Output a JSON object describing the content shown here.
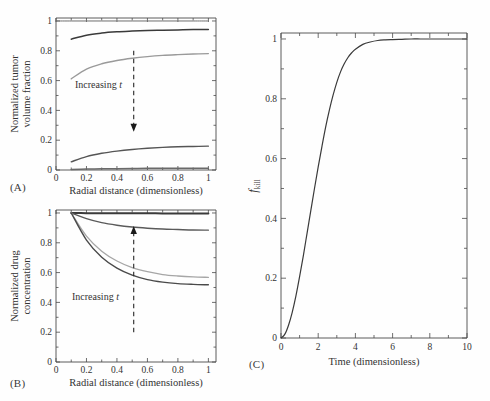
{
  "figure": {
    "background_color": "#fefefe",
    "axis_color": "#4a4a4a",
    "text_color": "#333333"
  },
  "panels": {
    "a": {
      "label": "(A)"
    },
    "b": {
      "label": "(B)"
    },
    "c": {
      "label": "(C)"
    }
  },
  "annotations": {
    "increasing_word": "Increasing",
    "increasing_var": "t",
    "arrow_a_direction": "down",
    "arrow_b_direction": "up"
  },
  "chart_data": [
    {
      "id": "panel-a",
      "type": "line",
      "title": "",
      "panel_label": "(A)",
      "xlabel": "Radial distance (dimensionless)",
      "ylabel": "Normalized tumor volume fraction",
      "xlim": [
        0,
        1.05
      ],
      "ylim": [
        0,
        1.02
      ],
      "xticks": [
        0,
        0.2,
        0.4,
        0.6,
        0.8,
        1
      ],
      "xtick_labels": [
        "0",
        "0.2",
        "0.4",
        "0.6",
        "0.8",
        "1"
      ],
      "yticks": [
        0,
        0.2,
        0.4,
        0.6,
        0.8,
        1
      ],
      "ytick_labels": [
        "0",
        "0.2",
        "0.4",
        "0.6",
        "0.8",
        "1"
      ],
      "minor_xticks": [
        0.1,
        0.3,
        0.5,
        0.7,
        0.9
      ],
      "minor_yticks": [
        0.1,
        0.3,
        0.5,
        0.7,
        0.9
      ],
      "grid": false,
      "legend": "none",
      "annotation": "Increasing t",
      "arrow": {
        "x": 0.51,
        "y_start": 0.8,
        "y_end": 0.27,
        "direction": "down",
        "style": "dashed"
      },
      "series": [
        {
          "name": "t1",
          "color": "#6e6e6e",
          "width": 1.0,
          "x": [
            0.0,
            0.1,
            0.2,
            0.3,
            0.4,
            0.5,
            0.6,
            0.7,
            0.8,
            0.9,
            1.0
          ],
          "values": [
            1.0,
            1.0,
            1.0,
            1.0,
            1.0,
            1.0,
            1.0,
            1.0,
            1.0,
            1.0,
            1.0
          ]
        },
        {
          "name": "t2",
          "color": "#3a3a3a",
          "width": 1.5,
          "x": [
            0.1,
            0.2,
            0.3,
            0.4,
            0.5,
            0.6,
            0.7,
            0.8,
            0.9,
            1.0
          ],
          "values": [
            0.878,
            0.905,
            0.919,
            0.927,
            0.932,
            0.936,
            0.938,
            0.94,
            0.942,
            0.943
          ]
        },
        {
          "name": "t3",
          "color": "#9a9a9a",
          "width": 1.4,
          "x": [
            0.1,
            0.2,
            0.3,
            0.4,
            0.5,
            0.6,
            0.7,
            0.8,
            0.9,
            1.0
          ],
          "values": [
            0.612,
            0.677,
            0.713,
            0.735,
            0.75,
            0.761,
            0.769,
            0.774,
            0.778,
            0.781
          ]
        },
        {
          "name": "t4",
          "color": "#555555",
          "width": 1.4,
          "x": [
            0.1,
            0.2,
            0.3,
            0.4,
            0.5,
            0.6,
            0.7,
            0.8,
            0.9,
            1.0
          ],
          "values": [
            0.055,
            0.09,
            0.112,
            0.127,
            0.138,
            0.146,
            0.152,
            0.156,
            0.158,
            0.16
          ]
        },
        {
          "name": "t5",
          "color": "#6a6a6a",
          "width": 1.5,
          "x": [
            0.1,
            0.2,
            0.3,
            0.4,
            0.5,
            0.6,
            0.7,
            0.8,
            0.9,
            1.0
          ],
          "values": [
            0.004,
            0.006,
            0.008,
            0.009,
            0.01,
            0.011,
            0.011,
            0.012,
            0.012,
            0.012
          ]
        }
      ]
    },
    {
      "id": "panel-b",
      "type": "line",
      "title": "",
      "panel_label": "(B)",
      "xlabel": "Radial distance (dimensionless)",
      "ylabel": "Normalized drug concentration",
      "xlim": [
        0,
        1.05
      ],
      "ylim": [
        0,
        1.02
      ],
      "xticks": [
        0,
        0.2,
        0.4,
        0.6,
        0.8,
        1
      ],
      "xtick_labels": [
        "0",
        "0.2",
        "0.4",
        "0.6",
        "0.8",
        "1"
      ],
      "yticks": [
        0,
        0.2,
        0.4,
        0.6,
        0.8,
        1
      ],
      "ytick_labels": [
        "0",
        "0.2",
        "0.4",
        "0.6",
        "0.8",
        "1"
      ],
      "minor_xticks": [
        0.1,
        0.3,
        0.5,
        0.7,
        0.9
      ],
      "minor_yticks": [
        0.1,
        0.3,
        0.5,
        0.7,
        0.9
      ],
      "grid": false,
      "legend": "none",
      "annotation": "Increasing t",
      "arrow": {
        "x": 0.51,
        "y_start": 0.2,
        "y_end": 0.9,
        "direction": "up",
        "style": "dashed"
      },
      "series": [
        {
          "name": "t1",
          "color": "#3a3a3a",
          "width": 2.0,
          "x": [
            0.1,
            0.2,
            0.3,
            0.4,
            0.5,
            0.6,
            0.7,
            0.8,
            0.9,
            1.0
          ],
          "values": [
            1.0,
            0.999,
            0.999,
            0.998,
            0.998,
            0.998,
            0.997,
            0.997,
            0.997,
            0.997
          ]
        },
        {
          "name": "t2",
          "color": "#5a5a5a",
          "width": 1.4,
          "x": [
            0.1,
            0.2,
            0.3,
            0.4,
            0.5,
            0.6,
            0.7,
            0.8,
            0.9,
            1.0
          ],
          "values": [
            1.0,
            0.962,
            0.935,
            0.918,
            0.906,
            0.898,
            0.892,
            0.889,
            0.886,
            0.885
          ]
        },
        {
          "name": "t3",
          "color": "#a6a6a6",
          "width": 1.3,
          "x": [
            0.1,
            0.2,
            0.3,
            0.4,
            0.5,
            0.6,
            0.7,
            0.8,
            0.9,
            1.0
          ],
          "values": [
            1.0,
            0.845,
            0.744,
            0.678,
            0.634,
            0.606,
            0.587,
            0.577,
            0.571,
            0.568
          ]
        },
        {
          "name": "t4",
          "color": "#4a4a4a",
          "width": 1.4,
          "x": [
            0.1,
            0.2,
            0.3,
            0.4,
            0.5,
            0.6,
            0.7,
            0.8,
            0.9,
            1.0
          ],
          "values": [
            1.0,
            0.818,
            0.703,
            0.63,
            0.583,
            0.553,
            0.536,
            0.526,
            0.521,
            0.518
          ]
        }
      ]
    },
    {
      "id": "panel-c",
      "type": "line",
      "title": "",
      "panel_label": "(C)",
      "xlabel": "Time (dimensionless)",
      "ylabel": "f_kill",
      "ylabel_base": "f",
      "ylabel_sub": "kill",
      "xlim": [
        0,
        10
      ],
      "ylim": [
        0,
        1.02
      ],
      "xticks": [
        0,
        2,
        4,
        6,
        8,
        10
      ],
      "xtick_labels": [
        "0",
        "2",
        "4",
        "6",
        "8",
        "10"
      ],
      "yticks": [
        0,
        0.2,
        0.4,
        0.6,
        0.8,
        1
      ],
      "ytick_labels": [
        "0",
        "0.2",
        "0.4",
        "0.6",
        "0.8",
        "1"
      ],
      "minor_xticks": [
        1,
        3,
        5,
        7,
        9
      ],
      "minor_yticks": [
        0.1,
        0.3,
        0.5,
        0.7,
        0.9
      ],
      "grid": false,
      "legend": "none",
      "series": [
        {
          "name": "f_kill",
          "color": "#3a3a3a",
          "width": 1.2,
          "x": [
            0,
            0.2,
            0.4,
            0.6,
            0.8,
            1.0,
            1.2,
            1.4,
            1.6,
            1.8,
            2.0,
            2.2,
            2.4,
            2.6,
            2.8,
            3.0,
            3.2,
            3.4,
            3.6,
            3.8,
            4.0,
            4.4,
            4.8,
            5.2,
            5.6,
            6.0,
            6.5,
            7.0,
            7.5,
            8.0,
            8.5,
            9.0,
            9.5,
            10.0
          ],
          "values": [
            0.0,
            0.012,
            0.042,
            0.085,
            0.14,
            0.205,
            0.275,
            0.35,
            0.425,
            0.5,
            0.572,
            0.64,
            0.705,
            0.762,
            0.812,
            0.855,
            0.89,
            0.917,
            0.938,
            0.954,
            0.966,
            0.982,
            0.99,
            0.995,
            0.997,
            0.998,
            0.999,
            1.0,
            1.0,
            1.0,
            1.0,
            1.0,
            1.0,
            1.0
          ]
        }
      ]
    }
  ]
}
